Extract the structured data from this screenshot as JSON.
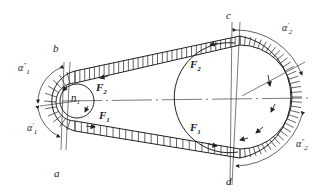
{
  "diagram": {
    "type": "belt-drive-tension-diagram",
    "colors": {
      "stroke": "#222222",
      "background": "#ffffff"
    },
    "labels": {
      "a": "a",
      "b": "b",
      "c": "c",
      "d": "d",
      "n1": "n",
      "n1_sub": "1",
      "F1_upper_left": "F",
      "F1_sub": "1",
      "F2_sub": "2",
      "F_base": "F",
      "alpha": "α",
      "alpha1_prime_sub": "1",
      "alpha1_prime_sup": "′",
      "alpha1_dprime_sub": "1",
      "alpha1_dprime_sup": "″",
      "alpha2_prime_sub": "2",
      "alpha2_prime_sup": "′",
      "alpha2_dprime_sub": "2",
      "alpha2_dprime_sup": "″"
    },
    "components": [
      {
        "name": "small-pulley",
        "label": "n1"
      },
      {
        "name": "large-pulley"
      },
      {
        "name": "tight-side-belt",
        "force": "F1"
      },
      {
        "name": "slack-side-belt",
        "force": "F2"
      }
    ]
  }
}
